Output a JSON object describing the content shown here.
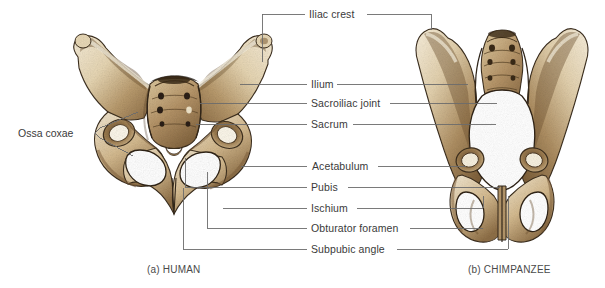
{
  "figure": {
    "background_color": "#ffffff",
    "leader_line_color": "#6b6b6b",
    "text_color": "#3a3a3a",
    "bone_light": "#f2e8d2",
    "bone_mid": "#c9ab7d",
    "bone_dark": "#7a5c38",
    "bone_outline": "#3d2f1e"
  },
  "labels": {
    "ossa_coxae": "Ossa coxae",
    "iliac_crest": "Iliac crest",
    "ilium": "Ilium",
    "sacroiliac_joint": "Sacroiliac joint",
    "sacrum": "Sacrum",
    "acetabulum": "Acetabulum",
    "pubis": "Pubis",
    "ischium": "Ischium",
    "obturator_foramen": "Obturator foramen",
    "subpubic_angle": "Subpubic angle"
  },
  "captions": {
    "human": "(a) HUMAN",
    "chimpanzee": "(b) CHIMPANZEE"
  },
  "specimens": [
    {
      "id": "human",
      "caption": "(a) HUMAN",
      "label_name": "human-pelvis-illustration"
    },
    {
      "id": "chimpanzee",
      "caption": "(b) CHIMPANZEE",
      "label_name": "chimpanzee-pelvis-illustration"
    }
  ],
  "callouts": [
    {
      "key": "iliac_crest",
      "text": "Iliac crest",
      "y": 18
    },
    {
      "key": "ilium",
      "text": "Ilium",
      "y": 84
    },
    {
      "key": "sacroiliac_joint",
      "text": "Sacroiliac joint",
      "y": 103
    },
    {
      "key": "sacrum",
      "text": "Sacrum",
      "y": 124
    },
    {
      "key": "acetabulum",
      "text": "Acetabulum",
      "y": 166
    },
    {
      "key": "pubis",
      "text": "Pubis",
      "y": 187
    },
    {
      "key": "ischium",
      "text": "Ischium",
      "y": 208
    },
    {
      "key": "obturator_foramen",
      "text": "Obturator foramen",
      "y": 228
    },
    {
      "key": "subpubic_angle",
      "text": "Subpubic angle",
      "y": 249
    }
  ]
}
